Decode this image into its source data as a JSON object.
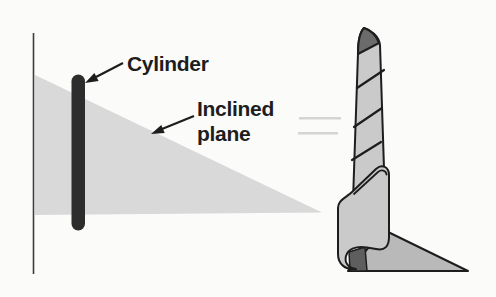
{
  "canvas": {
    "width": 496,
    "height": 297
  },
  "labels": {
    "cylinder": "Cylinder",
    "inclined_plane_line1": "Inclined",
    "inclined_plane_line2": "plane"
  },
  "colors": {
    "background": "#fbfbfa",
    "outline": "#1d1d1d",
    "axis_line": "#3c3c3c",
    "inclined_plane_fill": "#d9d9d9",
    "cylinder_fill": "#2d2d2d",
    "screw_tube_fill": "#cacaca",
    "tube_tip_flap_fill": "#6b6b6b",
    "flat_sheet_fill": "#b9b9b9",
    "shadow_wedge_fill": "#5e5e5e",
    "label_text": "#1d1d1d",
    "faint_note": "#bdbdbd"
  }
}
